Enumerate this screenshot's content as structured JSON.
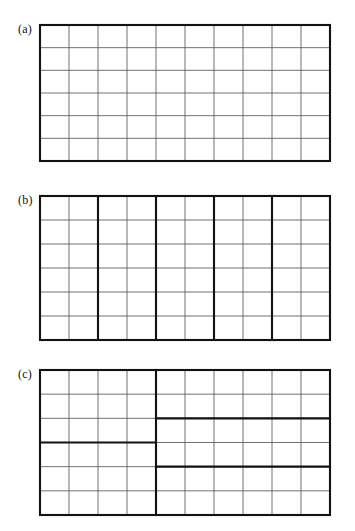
{
  "figure": {
    "caption_present": false,
    "background_color": "#ffffff",
    "thin_line_color": "#585858",
    "thick_line_color": "#121212",
    "columns": 10,
    "rows": 6
  },
  "panels": [
    {
      "id": "panel-a",
      "label": "(a)",
      "x": 40,
      "y": 25,
      "width": 290,
      "height": 136,
      "label_x": 18,
      "label_y": 23,
      "columns": 10,
      "rows": 6,
      "description": "uniform grid, no internal thick rules",
      "thick_vertical_columns": [],
      "thick_horizontal_rows": [],
      "thick_horizontal_segments": []
    },
    {
      "id": "panel-b",
      "label": "(b)",
      "x": 40,
      "y": 196,
      "width": 290,
      "height": 144,
      "label_x": 18,
      "label_y": 194,
      "columns": 10,
      "rows": 6,
      "description": "vertical strips of two columns each",
      "thick_vertical_columns": [
        2,
        4,
        6,
        8
      ],
      "thick_horizontal_rows": [],
      "thick_horizontal_segments": []
    },
    {
      "id": "panel-c",
      "label": "(c)",
      "x": 40,
      "y": 370,
      "width": 290,
      "height": 145,
      "label_x": 18,
      "label_y": 368,
      "columns": 10,
      "rows": 6,
      "description": "split into left and right halves with differing horizontal cuts",
      "thick_vertical_columns": [
        4
      ],
      "thick_horizontal_rows": [],
      "thick_horizontal_segments": [
        {
          "row": 3,
          "col_start": 0,
          "col_end": 4
        },
        {
          "row": 2,
          "col_start": 4,
          "col_end": 10
        },
        {
          "row": 4,
          "col_start": 4,
          "col_end": 10
        }
      ]
    }
  ]
}
